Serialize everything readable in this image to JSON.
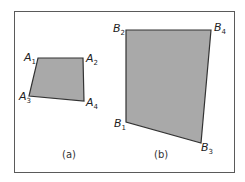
{
  "figure": {
    "colors": {
      "fill": "#a9a9a9",
      "stroke": "#333333",
      "frame": "#5a5a5a"
    },
    "panels": [
      {
        "caption": "(a)",
        "vertices": [
          {
            "name": "A",
            "sub": "1",
            "x": 38,
            "y": 58
          },
          {
            "name": "A",
            "sub": "2",
            "x": 83,
            "y": 58
          },
          {
            "name": "A",
            "sub": "3",
            "x": 29,
            "y": 96
          },
          {
            "name": "A",
            "sub": "4",
            "x": 84,
            "y": 101
          }
        ]
      },
      {
        "caption": "(b)",
        "vertices": [
          {
            "name": "B",
            "sub": "1",
            "x": 126,
            "y": 122
          },
          {
            "name": "B",
            "sub": "2",
            "x": 126,
            "y": 30
          },
          {
            "name": "B",
            "sub": "3",
            "x": 201,
            "y": 143
          },
          {
            "name": "B",
            "sub": "4",
            "x": 211,
            "y": 30
          }
        ]
      }
    ]
  }
}
